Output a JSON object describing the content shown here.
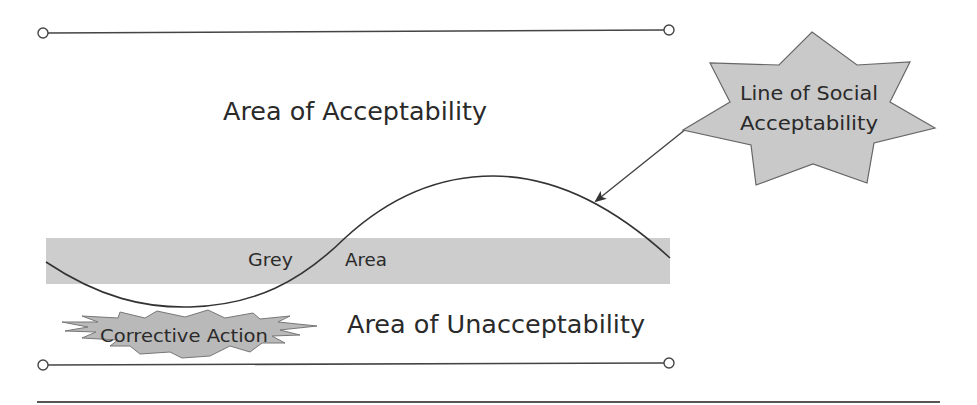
{
  "diagram": {
    "labels": {
      "area_acceptability": "Area of Acceptability",
      "area_unacceptability": "Area of Unacceptability",
      "grey_area_left": "Grey",
      "grey_area_right": "Area",
      "corrective_action": "Corrective Action",
      "social_line_1": "Line of Social",
      "social_line_2": "Acceptability"
    },
    "colors": {
      "band_fill": "#cdcdcd",
      "star_fill": "#c9c9c9",
      "line": "#333333",
      "text": "#2a2a2a",
      "background": "#ffffff"
    },
    "elements": [
      "upper-boundary-line",
      "lower-boundary-line",
      "grey-area-band",
      "social-acceptability-curve",
      "callout-arrow",
      "line-of-social-acceptability-starburst",
      "corrective-action-burst",
      "bottom-separator-rule"
    ]
  }
}
